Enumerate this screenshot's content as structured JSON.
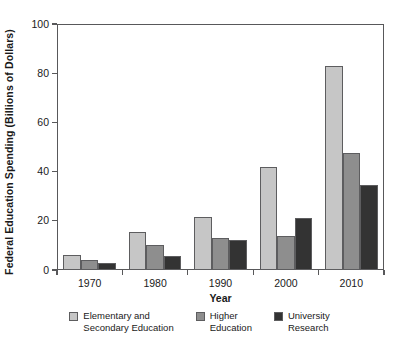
{
  "chart_data": {
    "type": "bar",
    "title": "",
    "xlabel": "Year",
    "ylabel": "Federal Education Spending (Billions of Dollars)",
    "categories": [
      "1970",
      "1980",
      "1990",
      "2000",
      "2010"
    ],
    "series": [
      {
        "name": "Elementary and\nSecondary Education",
        "color": "#c6c6c6",
        "values": [
          6,
          15.5,
          21.5,
          42,
          83
        ]
      },
      {
        "name": "Higher\nEducation",
        "color": "#8e8e8e",
        "values": [
          4,
          10,
          13,
          14,
          47.5
        ]
      },
      {
        "name": "University\nResearch",
        "color": "#333333",
        "values": [
          3,
          5.5,
          12,
          21,
          34.5
        ]
      }
    ],
    "ylim": [
      0,
      100
    ],
    "yticks": [
      0,
      20,
      40,
      60,
      80,
      100
    ],
    "ytick_labels": [
      "0",
      "20",
      "40",
      "60",
      "80",
      "100"
    ],
    "grid": false,
    "legend_position": "bottom"
  }
}
